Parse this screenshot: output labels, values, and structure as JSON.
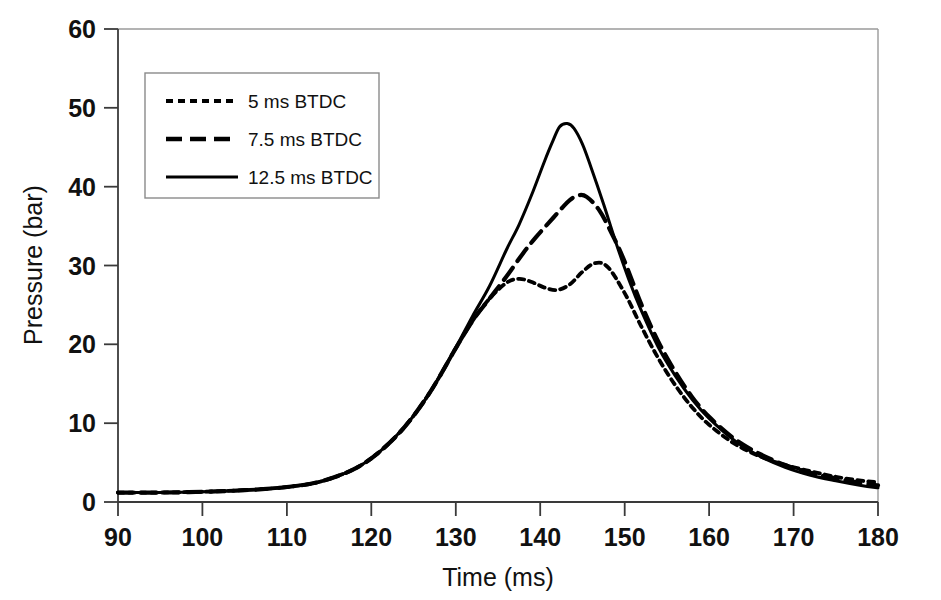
{
  "chart_data": {
    "type": "line",
    "title": "",
    "xlabel": "Time (ms)",
    "ylabel": "Pressure (bar)",
    "xlim": [
      90,
      180
    ],
    "ylim": [
      0,
      60
    ],
    "xticks": [
      90,
      100,
      110,
      120,
      130,
      140,
      150,
      160,
      170,
      180
    ],
    "yticks": [
      0,
      10,
      20,
      30,
      40,
      50,
      60
    ],
    "grid": false,
    "legend_position": "upper-left-inside",
    "series": [
      {
        "name": "5 ms BTDC",
        "style": "dotted",
        "color": "#000000",
        "x": [
          90,
          95,
          100,
          105,
          110,
          114,
          118,
          121,
          124,
          127,
          130,
          132,
          134,
          136,
          137.5,
          139,
          140.5,
          142,
          143.5,
          145,
          146.5,
          148,
          150,
          152,
          154,
          156,
          158,
          160,
          163,
          166,
          169,
          172,
          175,
          178,
          180
        ],
        "y": [
          1.2,
          1.2,
          1.3,
          1.5,
          1.9,
          2.6,
          4.2,
          6.4,
          9.6,
          14.0,
          19.5,
          23.0,
          25.8,
          27.8,
          28.3,
          27.9,
          27.2,
          26.9,
          27.6,
          29.2,
          30.3,
          29.8,
          26.5,
          22.2,
          18.2,
          14.8,
          12.0,
          9.8,
          7.4,
          5.8,
          4.7,
          3.9,
          3.2,
          2.7,
          2.5
        ]
      },
      {
        "name": "7.5 ms BTDC",
        "style": "dashed",
        "color": "#000000",
        "x": [
          90,
          95,
          100,
          105,
          110,
          114,
          118,
          121,
          124,
          127,
          130,
          132,
          134,
          136,
          138,
          139.5,
          141,
          142.5,
          143.5,
          144.5,
          145.5,
          147,
          148.5,
          150,
          152,
          154,
          156,
          158,
          160,
          163,
          166,
          169,
          172,
          175,
          178,
          180
        ],
        "y": [
          1.2,
          1.2,
          1.3,
          1.5,
          1.9,
          2.6,
          4.2,
          6.4,
          9.6,
          14.0,
          19.5,
          23.0,
          25.8,
          28.6,
          31.6,
          33.6,
          35.4,
          37.2,
          38.3,
          38.9,
          38.7,
          37.0,
          34.0,
          30.5,
          25.0,
          20.3,
          16.5,
          13.3,
          10.8,
          8.0,
          6.1,
          4.7,
          3.7,
          3.0,
          2.4,
          2.1
        ]
      },
      {
        "name": "12.5 ms BTDC",
        "style": "solid",
        "color": "#000000",
        "x": [
          90,
          95,
          100,
          105,
          110,
          114,
          118,
          121,
          124,
          127,
          130,
          132,
          134,
          136,
          137.5,
          139,
          140.5,
          141.5,
          142.3,
          143.2,
          144,
          145,
          146,
          147.5,
          149,
          150.5,
          152,
          154,
          156,
          158,
          160,
          163,
          166,
          169,
          172,
          175,
          178,
          180
        ],
        "y": [
          1.2,
          1.2,
          1.3,
          1.5,
          1.9,
          2.6,
          4.2,
          6.4,
          9.6,
          14.0,
          19.6,
          23.6,
          27.4,
          32.0,
          35.2,
          39.0,
          43.2,
          45.8,
          47.6,
          48.0,
          47.4,
          45.4,
          42.5,
          37.8,
          32.8,
          28.2,
          24.2,
          19.6,
          16.0,
          13.0,
          10.6,
          7.8,
          5.8,
          4.4,
          3.4,
          2.7,
          2.1,
          1.8
        ]
      }
    ]
  },
  "legend": {
    "items": [
      {
        "label": "5 ms BTDC",
        "style": "dotted"
      },
      {
        "label": "7.5 ms BTDC",
        "style": "dashed"
      },
      {
        "label": "12.5 ms BTDC",
        "style": "solid"
      }
    ]
  },
  "axes": {
    "x_title": "Time (ms)",
    "y_title": "Pressure (bar)",
    "x_tick_labels": [
      "90",
      "100",
      "110",
      "120",
      "130",
      "140",
      "150",
      "160",
      "170",
      "180"
    ],
    "y_tick_labels": [
      "0",
      "10",
      "20",
      "30",
      "40",
      "50",
      "60"
    ]
  },
  "colors": {
    "ink": "#000000",
    "frame": "#9a9a9a",
    "background": "#ffffff"
  }
}
